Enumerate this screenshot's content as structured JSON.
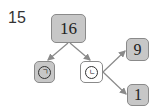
{
  "problem_number": "15",
  "tree": {
    "root": {
      "value": "16",
      "style": "shaded"
    },
    "left_child": {
      "label": "ㄱ",
      "style": "shaded"
    },
    "right_child": {
      "label": "ㄴ",
      "style": "blank"
    },
    "right_child_children": [
      {
        "value": "9",
        "style": "shaded"
      },
      {
        "value": "1",
        "style": "shaded"
      }
    ]
  },
  "colors": {
    "box_fill": "#c7c7c7",
    "box_border": "#8a8a8a",
    "arrow": "#8a8a8a"
  }
}
